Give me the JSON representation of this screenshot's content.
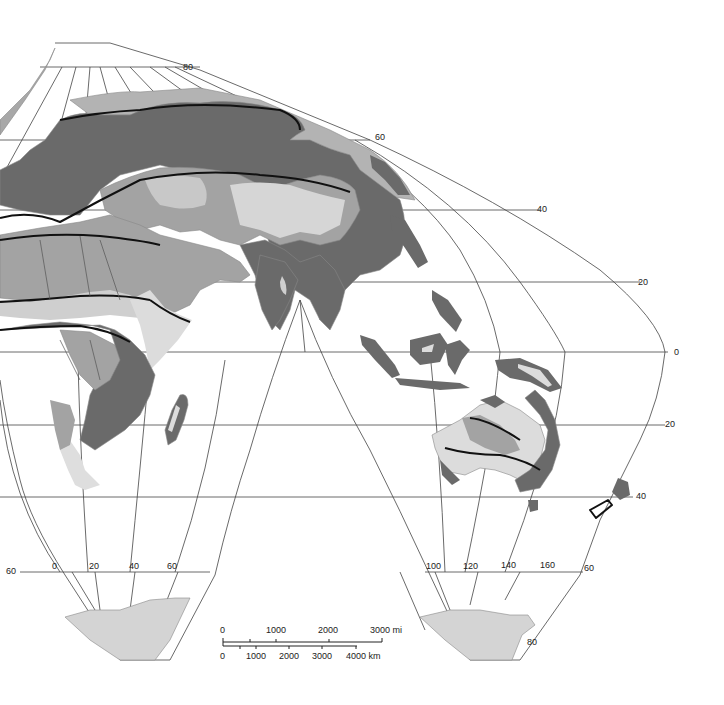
{
  "map": {
    "projection": "interrupted homolosine",
    "colors": {
      "background": "#ffffff",
      "dark_region": "#6a6a6a",
      "medium_region": "#a3a3a3",
      "light_region": "#cfcfcf",
      "lightest_region": "#e2e2e2",
      "graticule": "#444444",
      "boundary": "#111111"
    },
    "latitude_labels": {
      "n80": "80",
      "n60": "60",
      "n40": "40",
      "n20_a": "20",
      "eq": "0",
      "s20": "20",
      "s40": "40",
      "s60_left": "60",
      "s60_right": "60",
      "s80": "80"
    },
    "longitude_labels_left": [
      "0",
      "20",
      "40",
      "60"
    ],
    "longitude_labels_right": [
      "100",
      "120",
      "140",
      "160"
    ],
    "scale_bar": {
      "miles_ticks": [
        "0",
        "1000",
        "2000",
        "3000 mi"
      ],
      "km_ticks": [
        "0",
        "1000",
        "2000",
        "3000",
        "4000 km"
      ]
    }
  }
}
